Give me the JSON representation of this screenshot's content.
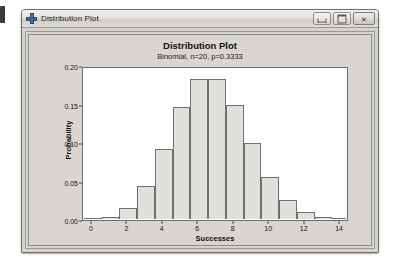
{
  "window": {
    "title": "Distribution Plot",
    "icon": "minitab-plus-icon",
    "controls": [
      {
        "name": "minimize-button",
        "label": "–"
      },
      {
        "name": "maximize-button",
        "label": "□"
      },
      {
        "name": "close-button",
        "label": "✕"
      }
    ]
  },
  "chart_data": {
    "type": "bar",
    "title": "Distribution Plot",
    "subtitle": "Binomial, n=20, p=0.3333",
    "xlabel": "Successes",
    "ylabel": "Probability",
    "categories": [
      0,
      1,
      2,
      3,
      4,
      5,
      6,
      7,
      8,
      9,
      10,
      11,
      12,
      13,
      14
    ],
    "values": [
      0.0003,
      0.003,
      0.0143,
      0.0429,
      0.0911,
      0.1457,
      0.1821,
      0.1821,
      0.148,
      0.0987,
      0.0543,
      0.0247,
      0.0092,
      0.0028,
      0.0007
    ],
    "xlim": [
      -0.5,
      14.5
    ],
    "ylim": [
      0,
      0.2
    ],
    "xticks": [
      0,
      2,
      4,
      6,
      8,
      10,
      12,
      14
    ],
    "xtick_labels": [
      "0",
      "2",
      "4",
      "6",
      "8",
      "10",
      "12",
      "14"
    ],
    "yticks": [
      0.0,
      0.05,
      0.1,
      0.15,
      0.2
    ],
    "ytick_labels": [
      "0.00",
      "0.05",
      "0.10",
      "0.15",
      "0.20"
    ],
    "grid": false,
    "legend": null,
    "bar_fill": "#e2e0dd",
    "bar_border": "#70706e",
    "plot_background": "#ffffff"
  }
}
